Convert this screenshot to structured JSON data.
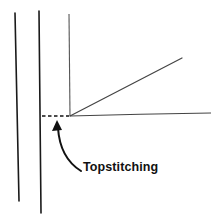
{
  "diagram": {
    "label": "Topstitching",
    "colors": {
      "background": "#ffffff",
      "ink": "#1a1a1a",
      "light_ink": "#555555"
    },
    "elements": [
      {
        "type": "line",
        "name": "outer-fold-line",
        "from": [
          15,
          13
        ],
        "to": [
          19,
          201
        ]
      },
      {
        "type": "line",
        "name": "seam-edge-line",
        "from": [
          39,
          11
        ],
        "to": [
          41,
          213
        ]
      },
      {
        "type": "line",
        "name": "pleat-vertical-line",
        "from": [
          69,
          14
        ],
        "to": [
          70,
          116
        ]
      },
      {
        "type": "dashed-line",
        "name": "topstitching-dashed-line",
        "from": [
          42,
          116
        ],
        "to": [
          69,
          116
        ]
      },
      {
        "type": "line",
        "name": "pleat-diagonal-line",
        "from": [
          70,
          116
        ],
        "to": [
          182,
          58
        ]
      },
      {
        "type": "line",
        "name": "pleat-horizontal-line",
        "from": [
          70,
          116
        ],
        "to": [
          211,
          113
        ]
      },
      {
        "type": "arrow",
        "name": "topstitching-arrow",
        "from": [
          81,
          171
        ],
        "to": [
          57,
          121
        ]
      }
    ]
  }
}
